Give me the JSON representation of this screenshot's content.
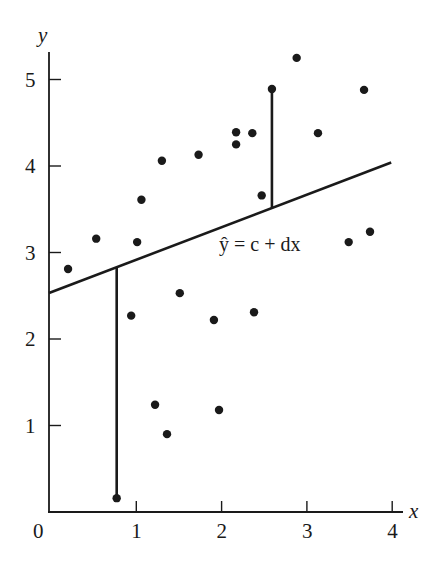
{
  "chart_data": {
    "type": "scatter",
    "title": "",
    "xlabel": "x",
    "ylabel": "y",
    "xlim": [
      0,
      4
    ],
    "ylim": [
      0,
      5.4
    ],
    "grid": false,
    "legend": null,
    "x_ticks": [
      {
        "value": 0,
        "label": "0"
      },
      {
        "value": 1,
        "label": "1"
      },
      {
        "value": 2,
        "label": "2"
      },
      {
        "value": 3,
        "label": "3"
      },
      {
        "value": 4,
        "label": "4"
      }
    ],
    "y_ticks": [
      {
        "value": 1,
        "label": "1"
      },
      {
        "value": 2,
        "label": "2"
      },
      {
        "value": 3,
        "label": "3"
      },
      {
        "value": 4,
        "label": "4"
      },
      {
        "value": 5,
        "label": "5"
      }
    ],
    "points": [
      {
        "x": 0.2,
        "y": 2.81
      },
      {
        "x": 0.53,
        "y": 3.16
      },
      {
        "x": 1.01,
        "y": 3.12
      },
      {
        "x": 1.06,
        "y": 3.61
      },
      {
        "x": 1.3,
        "y": 4.06
      },
      {
        "x": 1.73,
        "y": 4.13
      },
      {
        "x": 2.17,
        "y": 4.39
      },
      {
        "x": 2.17,
        "y": 4.25
      },
      {
        "x": 2.36,
        "y": 4.38
      },
      {
        "x": 2.47,
        "y": 3.66
      },
      {
        "x": 2.59,
        "y": 4.89
      },
      {
        "x": 2.88,
        "y": 5.25
      },
      {
        "x": 3.13,
        "y": 4.38
      },
      {
        "x": 3.49,
        "y": 3.12
      },
      {
        "x": 3.67,
        "y": 4.88
      },
      {
        "x": 3.74,
        "y": 3.24
      },
      {
        "x": 0.94,
        "y": 2.27
      },
      {
        "x": 1.51,
        "y": 2.53
      },
      {
        "x": 1.91,
        "y": 2.22
      },
      {
        "x": 2.38,
        "y": 2.31
      },
      {
        "x": 1.22,
        "y": 1.24
      },
      {
        "x": 1.97,
        "y": 1.18
      },
      {
        "x": 1.36,
        "y": 0.9
      },
      {
        "x": 0.77,
        "y": 0.16
      }
    ],
    "regression_line": {
      "equation_label": "ŷ = c + dx",
      "c": 2.54,
      "d": 0.375,
      "x_start": 0,
      "x_end": 4.0
    },
    "residual_segments": [
      {
        "x": 0.77,
        "y_point": 0.16,
        "y_line": 2.83
      },
      {
        "x": 2.59,
        "y_point": 4.89,
        "y_line": 3.51
      }
    ],
    "colors": {
      "ink": "#1a1a1a",
      "background": "#ffffff"
    }
  }
}
